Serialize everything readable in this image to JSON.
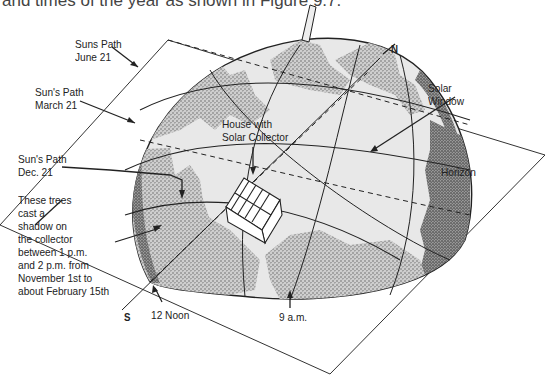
{
  "caption": "and times of the year as shown in Figure 9.7.",
  "labels": {
    "june_path": [
      "Suns Path",
      "June 21"
    ],
    "march_path": [
      "Sun's Path",
      "March 21"
    ],
    "dec_path": [
      "Sun's Path",
      "Dec. 21"
    ],
    "trees_note": [
      "These trees",
      "cast a",
      "shadow on",
      "the collector",
      "between 1 p.m.",
      "and 2 p.m. from",
      "November 1st to",
      "about February 15th"
    ],
    "house": [
      "House with",
      "Solar Collector"
    ],
    "solar_window": [
      "Solar",
      "Window"
    ],
    "horizon": "Horizon",
    "north": "N",
    "south": "S",
    "noon": "12 Noon",
    "nine_am": "9 a.m."
  },
  "colors": {
    "line": "#222222",
    "dome_fill": "#e6e6e6",
    "stipple": "#555555",
    "background": "#ffffff"
  }
}
